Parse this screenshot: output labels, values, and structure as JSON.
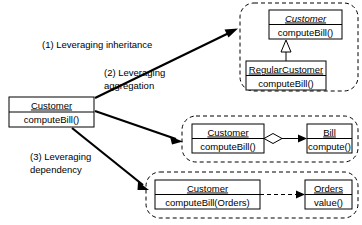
{
  "diagram": {
    "type": "uml-class-diagram",
    "background_color": "#ffffff",
    "line_color": "#000000",
    "source_class": {
      "name": "Customer",
      "operation": "computeBill()",
      "name_underlined": true
    },
    "edge_labels": [
      {
        "id": "label-1",
        "line1": "(1) Leveraging inheritance",
        "line2": ""
      },
      {
        "id": "label-2",
        "line1": "(2) Leveraging",
        "line2": "aggregation"
      },
      {
        "id": "label-3",
        "line1": "(3) Leveraging",
        "line2": "dependency"
      }
    ],
    "groups": [
      {
        "id": "group-inheritance",
        "relationship": "generalization",
        "connector": "hollow-triangle",
        "connector_line_style": "solid",
        "classes": [
          {
            "id": "class-customer-abstract",
            "name": "Customer",
            "operation": "computeBill()",
            "abstract": true,
            "name_underlined": true
          },
          {
            "id": "class-regular-customer",
            "name": "RegularCustomer",
            "operation": "computeBill()",
            "abstract": false,
            "name_underlined": true
          }
        ]
      },
      {
        "id": "group-aggregation",
        "relationship": "aggregation",
        "connector": "hollow-diamond",
        "connector_line_style": "solid",
        "classes": [
          {
            "id": "class-customer-agg",
            "name": "Customer",
            "operation": "computeBill()",
            "abstract": false,
            "name_underlined": true
          },
          {
            "id": "class-bill",
            "name": "Bill",
            "operation": "compute()",
            "abstract": false,
            "name_underlined": true
          }
        ]
      },
      {
        "id": "group-dependency",
        "relationship": "dependency",
        "connector": "open-arrow",
        "connector_line_style": "dashed",
        "classes": [
          {
            "id": "class-customer-dep",
            "name": "Customer",
            "operation": "computeBill(Orders)",
            "abstract": false,
            "name_underlined": true
          },
          {
            "id": "class-orders",
            "name": "Orders",
            "operation": "value()",
            "abstract": false,
            "name_underlined": true
          }
        ]
      }
    ]
  }
}
